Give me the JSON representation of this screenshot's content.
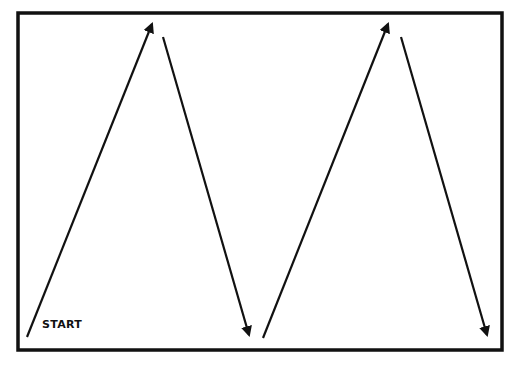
{
  "diagram": {
    "type": "zigzag-path",
    "frame": {
      "x": 18,
      "y": 13,
      "width": 484,
      "height": 337,
      "stroke": "#111111",
      "stroke_width": 3.5
    },
    "start_label": "START",
    "arrows": [
      {
        "from": [
          27,
          337
        ],
        "to": [
          152,
          24
        ],
        "direction": "up"
      },
      {
        "from": [
          163,
          37
        ],
        "to": [
          249,
          335
        ],
        "direction": "down"
      },
      {
        "from": [
          263,
          338
        ],
        "to": [
          388,
          24
        ],
        "direction": "up"
      },
      {
        "from": [
          401,
          37
        ],
        "to": [
          487,
          335
        ],
        "direction": "down"
      }
    ],
    "arrow_color": "#111111"
  }
}
